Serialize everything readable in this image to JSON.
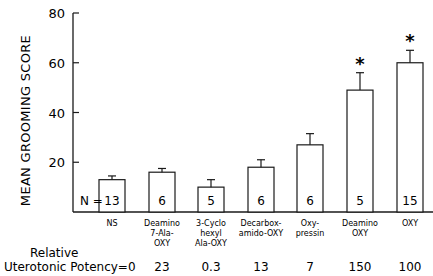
{
  "chart_data": {
    "type": "bar",
    "title": "",
    "ylabel": "MEAN GROOMING SCORE",
    "xlabel": "",
    "ylim": [
      0,
      80
    ],
    "yticks": [
      20,
      40,
      60,
      80
    ],
    "grid": false,
    "categories": [
      [
        "NS"
      ],
      [
        "Deamino",
        "7-Ala-",
        "OXY"
      ],
      [
        "3-Cyclo",
        "hexyl",
        "Ala-OXY"
      ],
      [
        "Decarbox-",
        "amido-OXY"
      ],
      [
        "Oxy-",
        "pressin"
      ],
      [
        "Deamino",
        "OXY"
      ],
      [
        "OXY"
      ]
    ],
    "values": [
      13,
      16,
      10,
      18,
      27,
      49,
      60
    ],
    "error_upper": [
      14.5,
      17.5,
      13,
      21,
      31.5,
      56,
      65
    ],
    "significant": [
      false,
      false,
      false,
      false,
      false,
      true,
      true
    ],
    "significance_marker": "*",
    "n_label": "N =",
    "n_values": [
      "13",
      "6",
      "5",
      "6",
      "6",
      "5",
      "15"
    ],
    "potency_label_line1": "Relative",
    "potency_label_line2": "Uterotonic Potency=0",
    "potency_values": [
      "",
      "23",
      "0.3",
      "13",
      "7",
      "150",
      "100"
    ]
  }
}
